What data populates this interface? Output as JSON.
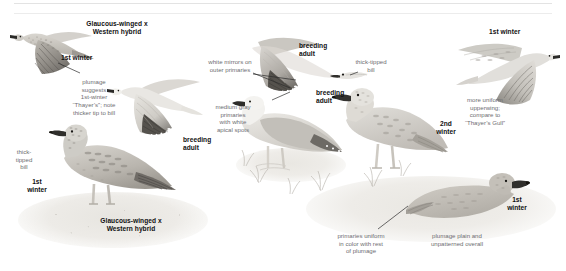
{
  "page": {
    "running_head": "",
    "background": "#ffffff",
    "label_color": "#111111",
    "note_color": "#6e6e72"
  },
  "plate": {
    "title": "Gull identification plate",
    "species_groups": [
      "Glaucous-winged x Western hybrid",
      "Glaucous-winged Gull"
    ]
  },
  "labels": {
    "hybrid_heading_top": "Glaucous-winged x\nWestern hybrid",
    "first_winter_flight_left": "1st winter",
    "breeding_adult_flight_left": "breeding\nadult",
    "first_winter_standing_left": "1st\nwinter",
    "hybrid_heading_bottom": "Glaucous-winged x\nWestern hybrid",
    "breeding_adult_flight_mid": "breeding\nadult",
    "breeding_adult_standing": "breeding\nadult",
    "second_winter_standing": "2nd\nwinter",
    "first_winter_flight_right": "1st winter",
    "first_winter_sitting_right": "1st\nwinter"
  },
  "notes": {
    "plumage_suggests": "plumage\nsuggests\n1st-winter\n“Thayer’s”; note\nthicker tip to bill",
    "thick_tipped_bill_left": "thick-\ntipped\nbill",
    "white_mirrors": "white mirrors on\nouter primaries",
    "medium_gray_primaries": "medium gray\nprimaries\nwith white\napical spots",
    "thick_tipped_bill_mid": "thick-tipped\nbill",
    "more_uniform_upperwing": "more uniform\nupperwing;\ncompare to\n“Thayer’s Gull”",
    "primaries_uniform": "primaries uniform\nin color with rest\nof plumage",
    "plumage_plain": "plumage plain and\nunpatterned overall"
  },
  "figures": [
    {
      "id": "fig-1st-winter-flight-left",
      "caption": "1st winter",
      "pose": "flight"
    },
    {
      "id": "fig-breeding-adult-flight-left",
      "caption": "breeding adult",
      "pose": "flight"
    },
    {
      "id": "fig-1st-winter-standing-left",
      "caption": "1st winter",
      "pose": "standing"
    },
    {
      "id": "fig-breeding-adult-flight-mid",
      "caption": "breeding adult",
      "pose": "flight"
    },
    {
      "id": "fig-breeding-adult-standing",
      "caption": "breeding adult",
      "pose": "standing"
    },
    {
      "id": "fig-2nd-winter-standing",
      "caption": "2nd winter",
      "pose": "standing"
    },
    {
      "id": "fig-1st-winter-flight-right",
      "caption": "1st winter",
      "pose": "flight"
    },
    {
      "id": "fig-1st-winter-sitting-right",
      "caption": "1st winter",
      "pose": "sitting"
    }
  ]
}
